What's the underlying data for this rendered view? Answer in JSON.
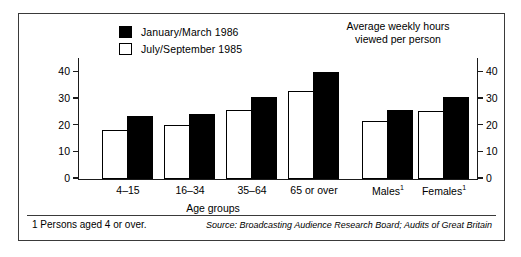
{
  "chart_data": {
    "type": "bar",
    "title": "",
    "subtitle": "",
    "unit_caption_line1": "Average weekly hours",
    "unit_caption_line2": "viewed per person",
    "xlabel": "Age groups",
    "ylabel": "",
    "ylim": [
      0,
      45
    ],
    "yticks": [
      0,
      10,
      20,
      30,
      40
    ],
    "ytick_labels": [
      "0",
      "10",
      "20",
      "30",
      "40"
    ],
    "right_axis_ticks": [
      0,
      10,
      20,
      30,
      40
    ],
    "right_axis_tick_labels": [
      "0",
      "10",
      "20",
      "30",
      "40"
    ],
    "grid": false,
    "legend_position": "top-left",
    "categories": [
      "4–15",
      "16–34",
      "35–64",
      "65 or over",
      "Males",
      "Females"
    ],
    "category_superscripts": [
      "",
      "",
      "",
      "",
      "1",
      "1"
    ],
    "series": [
      {
        "name": "July/September 1985",
        "style": "hollow",
        "values": [
          18.4,
          20.2,
          25.7,
          33.0,
          21.6,
          25.2
        ]
      },
      {
        "name": "January/March 1986",
        "style": "filled",
        "values": [
          23.5,
          24.2,
          30.6,
          40.1,
          25.8,
          30.5
        ]
      }
    ]
  },
  "legend": {
    "items": [
      {
        "label": "January/March  1986",
        "swatch": "filled"
      },
      {
        "label": "July/September  1985",
        "swatch": "hollow"
      }
    ]
  },
  "footer": {
    "footnote": "1 Persons aged 4 or over.",
    "source": "Source: Broadcasting Audience Research Board; Audits of Great Britain"
  }
}
